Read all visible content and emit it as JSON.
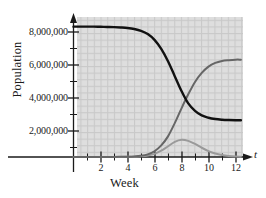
{
  "figure": {
    "axis_label_x": "Week",
    "axis_variable_x": "t",
    "axis_label_y": "Population"
  },
  "chart_data": {
    "type": "line",
    "title": "",
    "xlabel": "Week",
    "ylabel": "Population",
    "xlim": [
      0,
      12.8
    ],
    "ylim": [
      0,
      8600000
    ],
    "grid": true,
    "grid_style": "dotted",
    "legend": "none",
    "xticks": [
      2,
      4,
      6,
      8,
      10,
      12
    ],
    "xtick_labels": [
      "2",
      "4",
      "6",
      "8",
      "10",
      "12"
    ],
    "yticks": [
      2000000,
      4000000,
      6000000,
      8000000
    ],
    "ytick_labels": [
      "2,000,000",
      "4,000,000",
      "6,000,000",
      "8,000,000"
    ],
    "series": [
      {
        "name": "susceptible",
        "color": "#111111",
        "width": 2.4,
        "description": "Decreasing sigmoid from 7,900,000 down to 2,200,000",
        "x": [
          0,
          0.5,
          1,
          1.5,
          2,
          2.5,
          3,
          3.5,
          4,
          4.5,
          5,
          5.5,
          6,
          6.5,
          7,
          7.5,
          8,
          8.5,
          9,
          9.5,
          10,
          10.5,
          11,
          11.5,
          12,
          12.4
        ],
        "y": [
          7900000,
          7900000,
          7900000,
          7900000,
          7890000,
          7880000,
          7870000,
          7850000,
          7820000,
          7760000,
          7650000,
          7450000,
          7100000,
          6550000,
          5800000,
          4900000,
          4000000,
          3250000,
          2800000,
          2520000,
          2380000,
          2300000,
          2260000,
          2240000,
          2230000,
          2230000
        ]
      },
      {
        "name": "recovered",
        "color": "#666666",
        "width": 2.0,
        "description": "Increasing sigmoid from 0 up to 5,900,000",
        "x": [
          0,
          1,
          2,
          3,
          4,
          4.5,
          5,
          5.5,
          6,
          6.5,
          7,
          7.5,
          8,
          8.5,
          9,
          9.5,
          10,
          10.5,
          11,
          11.5,
          12,
          12.4
        ],
        "y": [
          0,
          0,
          0,
          5000,
          15000,
          30000,
          70000,
          160000,
          350000,
          700000,
          1250000,
          2050000,
          2950000,
          3800000,
          4550000,
          5100000,
          5480000,
          5700000,
          5820000,
          5870000,
          5900000,
          5900000
        ]
      },
      {
        "name": "infected",
        "color": "#9a9a9a",
        "width": 2.0,
        "description": "Bell-shaped outbreak curve peaking near week 8 at about 1,050,000",
        "x": [
          0,
          1,
          2,
          3,
          4,
          4.5,
          5,
          5.5,
          6,
          6.5,
          7,
          7.5,
          8,
          8.5,
          9,
          9.5,
          10,
          10.5,
          11,
          11.5,
          12,
          12.4
        ],
        "y": [
          0,
          0,
          0,
          2000,
          8000,
          18000,
          40000,
          90000,
          190000,
          380000,
          650000,
          920000,
          1050000,
          980000,
          790000,
          560000,
          360000,
          210000,
          115000,
          60000,
          30000,
          20000
        ]
      }
    ]
  }
}
